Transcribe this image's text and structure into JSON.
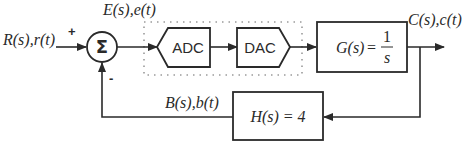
{
  "diagram": {
    "type": "closed-loop feedback block diagram",
    "signals": {
      "input": "R(s),r(t)",
      "error": "E(s),e(t)",
      "output": "C(s),c(t)",
      "feedback": "B(s),b(t)"
    },
    "summing_junction": {
      "symbol": "Σ",
      "plus_sign": "+",
      "minus_sign": "-"
    },
    "blocks": {
      "adc": "ADC",
      "dac": "DAC",
      "forward": {
        "lhs": "G(s)",
        "eq": "=",
        "numerator": "1",
        "denominator": "s"
      },
      "feedback": {
        "label": "H(s) = 4"
      }
    },
    "colors": {
      "stroke": "#2a2a2a",
      "dotted_box": "#9a9a9a",
      "background": "#ffffff"
    }
  }
}
